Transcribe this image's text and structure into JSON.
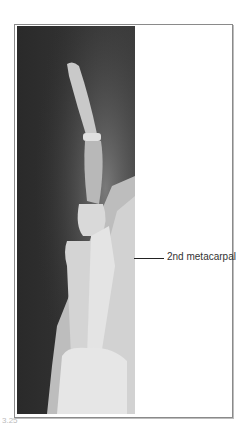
{
  "figure": {
    "image_description": "Lateral X-ray of finger and hand",
    "label": "2nd metacarpal",
    "caption_fragment": "3.25"
  },
  "colors": {
    "xray_background": "#2e2e2e",
    "bone_light": "#d8d8d8",
    "frame_border": "#8a8a8a",
    "label_text": "#333333"
  }
}
